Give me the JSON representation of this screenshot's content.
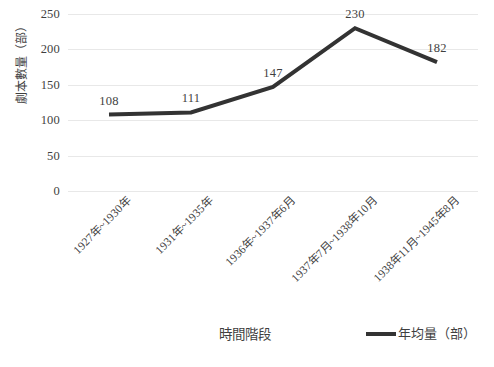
{
  "chart_data": {
    "type": "line",
    "title": "",
    "subtitle": "",
    "xlabel": "時間階段",
    "ylabel": "劇本數量（部）",
    "categories": [
      "1927年~1930年",
      "1931年~1935年",
      "1936年~1937年6月",
      "1937年7月~1938年10月",
      "1938年11月~1945年8月"
    ],
    "series": [
      {
        "name": "年均量（部）",
        "values": [
          108,
          111,
          147,
          230,
          182
        ],
        "color": "#333333"
      }
    ],
    "data_labels": [
      "108",
      "111",
      "147",
      "230",
      "182"
    ],
    "ylim": [
      0,
      250
    ],
    "yticks": [
      0,
      50,
      100,
      150,
      200,
      250
    ],
    "ytick_labels": [
      "0",
      "50",
      "100",
      "150",
      "200",
      "250"
    ],
    "grid": true,
    "grid_color": "#e8e8e8",
    "legend_position": "bottom-right",
    "legend": [
      "年均量（部）"
    ],
    "markers": false,
    "line_width": 4
  },
  "axes": {
    "y_title": "劇本數量（部）",
    "x_title": "時間階段"
  },
  "legend": {
    "entries": [
      {
        "label": "年均量（部）",
        "color": "#333333"
      }
    ]
  }
}
